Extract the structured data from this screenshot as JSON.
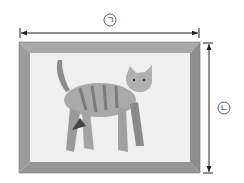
{
  "diagram": {
    "labels": {
      "width": "ㄱ",
      "height": "ㄴ"
    },
    "colors": {
      "frame": "#9a9a9a",
      "frame_light": "#b8b8b8",
      "canvas": "#efefef",
      "line": "#222222"
    },
    "picture": "cat-illustration"
  }
}
